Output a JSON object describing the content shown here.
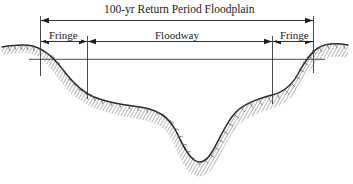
{
  "figure": {
    "type": "cross-section-diagram",
    "background_color": "#ffffff",
    "line_color": "#1a1a1a",
    "ground_shade_color": "#6e6e6e",
    "width": 353,
    "height": 184
  },
  "labels": {
    "title": "100-yr Return Period Floodplain",
    "floodway": "Floodway",
    "fringe_left": "Fringe",
    "fringe_right": "Fringe"
  },
  "dimensions": {
    "floodplain": {
      "label": "100-yr Return Period Floodplain",
      "left_x": 40,
      "right_x": 313,
      "y": 20
    },
    "fringe_left": {
      "label": "Fringe",
      "left_x": 40,
      "right_x": 87,
      "y": 41
    },
    "floodway": {
      "label": "Floodway",
      "left_x": 87,
      "right_x": 272,
      "y": 41
    },
    "fringe_right": {
      "label": "Fringe",
      "left_x": 272,
      "right_x": 313,
      "y": 41
    }
  },
  "water_surface": {
    "name": "100-yr flood water surface line",
    "y": 59,
    "left_x": 28,
    "right_x": 326
  },
  "icon_names": {
    "arrow_left": "arrow-left-icon",
    "arrow_right": "arrow-right-icon",
    "extension_line": "extension-line",
    "ground-profile": "terrain-profile-icon"
  }
}
